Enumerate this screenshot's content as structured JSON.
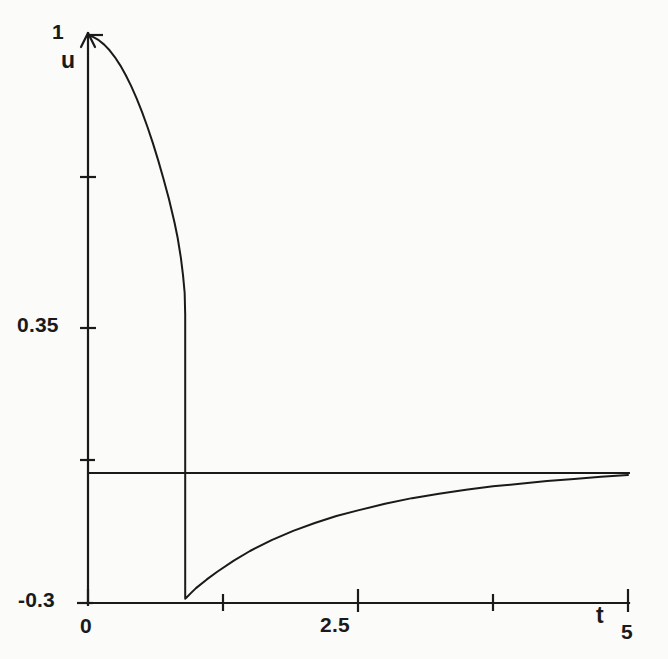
{
  "figure": {
    "background_color": "#fbfbfa",
    "ink_color": "#1a1a1a"
  },
  "chart_data": {
    "type": "line",
    "title": "",
    "subtitle": "",
    "xlabel": "t",
    "ylabel": "u",
    "xlim": [
      0,
      5
    ],
    "ylim": [
      -0.3,
      1
    ],
    "grid": false,
    "legend": null,
    "xticks": [
      0,
      1.25,
      2.5,
      3.75,
      5
    ],
    "xtick_labels": [
      "0",
      "",
      "2.5",
      "",
      "5"
    ],
    "yticks": [
      -0.3,
      0,
      0.35,
      0.675,
      1
    ],
    "ytick_labels": [
      "-0.3",
      "",
      "0.35",
      "",
      "1"
    ],
    "annotations": [
      {
        "name": "zero-baseline",
        "type": "horizontal-line",
        "y": 0,
        "x_start": 0,
        "x_end": 5
      }
    ],
    "series": [
      {
        "name": "u(t)",
        "color": "#1a1a1a",
        "line_width": 2,
        "x": [
          0.0,
          0.05,
          0.1,
          0.15,
          0.2,
          0.25,
          0.3,
          0.35,
          0.4,
          0.45,
          0.5,
          0.55,
          0.6,
          0.65,
          0.7,
          0.75,
          0.8,
          0.83,
          0.86,
          0.88,
          0.895,
          0.9,
          0.9,
          0.9,
          0.9,
          0.9,
          0.91,
          0.95,
          1.0,
          1.1,
          1.2,
          1.35,
          1.5,
          1.7,
          1.9,
          2.1,
          2.3,
          2.5,
          2.75,
          3.0,
          3.25,
          3.5,
          3.75,
          4.0,
          4.25,
          4.5,
          4.75,
          5.0
        ],
        "y": [
          1.0,
          0.995,
          0.988,
          0.978,
          0.965,
          0.949,
          0.93,
          0.908,
          0.883,
          0.855,
          0.824,
          0.79,
          0.753,
          0.713,
          0.67,
          0.624,
          0.572,
          0.536,
          0.49,
          0.45,
          0.41,
          0.36,
          0.15,
          -0.05,
          -0.2,
          -0.29,
          -0.288,
          -0.278,
          -0.266,
          -0.246,
          -0.228,
          -0.203,
          -0.181,
          -0.156,
          -0.135,
          -0.117,
          -0.101,
          -0.088,
          -0.073,
          -0.06,
          -0.05,
          -0.041,
          -0.033,
          -0.027,
          -0.021,
          -0.016,
          -0.011,
          -0.007
        ]
      }
    ]
  },
  "labels": {
    "y_top": "1",
    "y_mid": "0.35",
    "y_bottom": "-0.3",
    "x_left": "0",
    "x_center": "2.5",
    "x_right": "5",
    "y_axis_name": "u",
    "x_axis_name": "t"
  }
}
